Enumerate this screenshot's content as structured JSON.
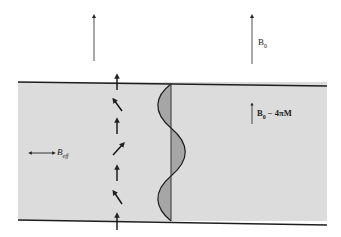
{
  "colors": {
    "background": "#ffffff",
    "film": "#dcdcdc",
    "film_edge": "#1e1e1e",
    "wall_fill": "#a6a6a6",
    "ink": "#222222"
  },
  "labels": {
    "external_field": {
      "main": "B",
      "sub": "0"
    },
    "internal_field": {
      "main": "B",
      "sub": "0",
      "suffix": " − 4πM"
    },
    "in_plane_field": {
      "main": "B",
      "sub": "eff"
    }
  },
  "domain_wall": {
    "spin_arrows": [
      "up",
      "up-left",
      "up",
      "up-right",
      "up",
      "up-left",
      "up"
    ]
  }
}
